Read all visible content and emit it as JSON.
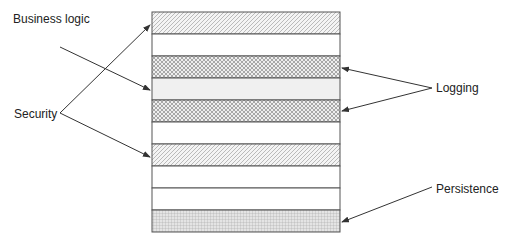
{
  "diagram": {
    "labels": {
      "business_logic": "Business logic",
      "security": "Security",
      "logging": "Logging",
      "persistence": "Persistence"
    },
    "bands": [
      {
        "index": 0,
        "fill": "diagonal-hatch",
        "concern": "Security"
      },
      {
        "index": 1,
        "fill": "none",
        "concern": ""
      },
      {
        "index": 2,
        "fill": "crosshatch",
        "concern": "Logging"
      },
      {
        "index": 3,
        "fill": "light-gray",
        "concern": "Business logic"
      },
      {
        "index": 4,
        "fill": "crosshatch",
        "concern": "Logging"
      },
      {
        "index": 5,
        "fill": "none",
        "concern": ""
      },
      {
        "index": 6,
        "fill": "diagonal-hatch",
        "concern": "Security"
      },
      {
        "index": 7,
        "fill": "none",
        "concern": ""
      },
      {
        "index": 8,
        "fill": "none",
        "concern": ""
      },
      {
        "index": 9,
        "fill": "grid",
        "concern": "Persistence"
      }
    ],
    "colors": {
      "stroke": "#555555",
      "arrow": "#333333",
      "hatch": "#9a9a9a",
      "light_fill": "#f0f0f0"
    }
  }
}
